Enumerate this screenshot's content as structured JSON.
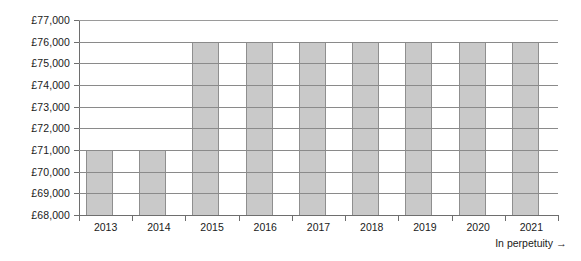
{
  "chart_data": {
    "type": "bar",
    "title": "",
    "subtitle": "",
    "xlabel": "",
    "ylabel": "",
    "categories": [
      "2013",
      "2014",
      "2015",
      "2016",
      "2017",
      "2018",
      "2019",
      "2020",
      "2021"
    ],
    "values": [
      71000,
      71000,
      76000,
      76000,
      76000,
      76000,
      76000,
      76000,
      76000
    ],
    "ylim": [
      68000,
      77000
    ],
    "ytick_values": [
      68000,
      69000,
      70000,
      71000,
      72000,
      73000,
      74000,
      75000,
      76000,
      77000
    ],
    "ytick_labels": [
      "£68,000",
      "£69,000",
      "£70,000",
      "£71,000",
      "£72,000",
      "£73,000",
      "£74,000",
      "£75,000",
      "£76,000",
      "£77,000"
    ],
    "currency_symbol": "£",
    "grid": true,
    "grid_axis": "y",
    "legend": false,
    "legend_position": "none",
    "bar_color": "#c9c9c9",
    "bar_edge_color": "#8f8f8f",
    "gridline_color": "#8a8a8a",
    "axis_color": "#6e6e6e",
    "background_color": "#ffffff",
    "annotations": [
      {
        "name": "in-perpetuity",
        "text": "In perpetuity",
        "arrow": "→",
        "position": "bottom-right"
      }
    ]
  }
}
